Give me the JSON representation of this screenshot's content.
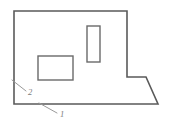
{
  "diagram": {
    "type": "technical-line-drawing",
    "background_color": "#ffffff",
    "outline": {
      "name": "main-body-outline",
      "stroke_color": "#5a5a5a",
      "points": "14,11 127,11 127,77 146,77 158,104 14,104 14,11"
    },
    "features": [
      {
        "name": "horizontal-cutout",
        "shape": "rectangle",
        "x": 38,
        "y": 56,
        "width": 35,
        "height": 24,
        "stroke_color": "#6a6a6a"
      },
      {
        "name": "vertical-cutout",
        "shape": "rectangle",
        "x": 87,
        "y": 26,
        "width": 13,
        "height": 36,
        "stroke_color": "#6a6a6a"
      }
    ],
    "callouts": [
      {
        "label": "2",
        "name": "callout-2",
        "leader": "12,80 26,91",
        "text_x": 28,
        "text_y": 95,
        "stroke_color": "#9a9a9a"
      },
      {
        "label": "1",
        "name": "callout-1",
        "leader": "39,103 57,113",
        "text_x": 60,
        "text_y": 117,
        "stroke_color": "#9a9a9a"
      }
    ]
  }
}
